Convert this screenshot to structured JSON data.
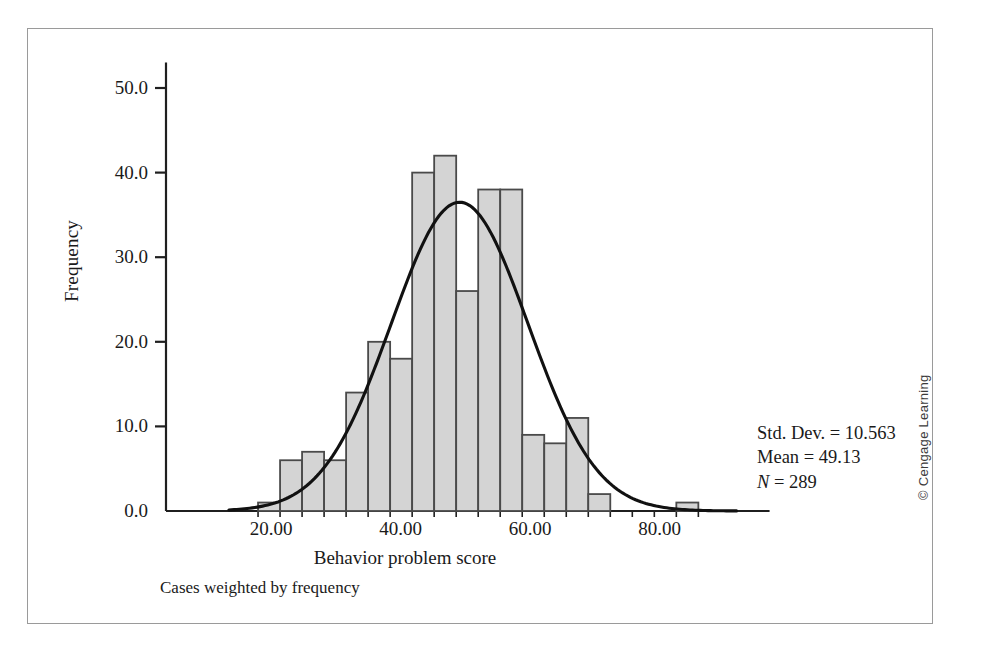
{
  "figure": {
    "caption_note": "Cases weighted by frequency",
    "copyright": "© Cengage Learning"
  },
  "annotation": {
    "std_dev_line": "Std. Dev. = 10.563",
    "mean_line": "Mean = 49.13",
    "n_symbol": "N",
    "n_value": " = 289"
  },
  "chart_data": {
    "type": "bar",
    "title": "",
    "subtitle": "",
    "xlabel": "Behavior problem score",
    "ylabel": "Frequency",
    "xlim": [
      13,
      97
    ],
    "ylim": [
      0,
      53
    ],
    "xticks": [
      20,
      40,
      60,
      80
    ],
    "xtick_labels": [
      "20.00",
      "40.00",
      "60.00",
      "80.00"
    ],
    "yticks": [
      0,
      10,
      20,
      30,
      40,
      50
    ],
    "ytick_labels": [
      "0.0",
      "10.0",
      "20.0",
      "30.0",
      "40.0",
      "50.0"
    ],
    "grid": false,
    "legend": "none",
    "bar_color": "#d4d4d4",
    "bar_edge_color": "#4a4a4a",
    "curve_color": "#111111",
    "bin_width": 3.4,
    "bin_starts": [
      18.0,
      21.4,
      24.8,
      28.2,
      31.6,
      35.0,
      38.4,
      41.8,
      45.2,
      48.6,
      52.0,
      55.4,
      58.8,
      62.2,
      65.6,
      69.0,
      72.4,
      75.8,
      79.2,
      82.6
    ],
    "categories": [
      "18.0-21.4",
      "21.4-24.8",
      "24.8-28.2",
      "28.2-31.6",
      "31.6-35.0",
      "35.0-38.4",
      "38.4-41.8",
      "41.8-45.2",
      "45.2-48.6",
      "48.6-52.0",
      "52.0-55.4",
      "55.4-58.8",
      "58.8-62.2",
      "62.2-65.6",
      "65.6-69.0",
      "69.0-72.4",
      "72.4-75.8",
      "75.8-79.2",
      "79.2-82.6",
      "82.6-86.0"
    ],
    "values": [
      1,
      6,
      7,
      6,
      14,
      20,
      18,
      40,
      42,
      26,
      38,
      38,
      9,
      8,
      11,
      2,
      0,
      0,
      0,
      1
    ],
    "normal_curve": {
      "shown": true,
      "mean": 49.13,
      "std_dev": 10.563,
      "n": 289,
      "peak_height": 36.5
    },
    "annotations": [
      "Std. Dev. = 10.563",
      "Mean = 49.13",
      "N = 289"
    ]
  }
}
